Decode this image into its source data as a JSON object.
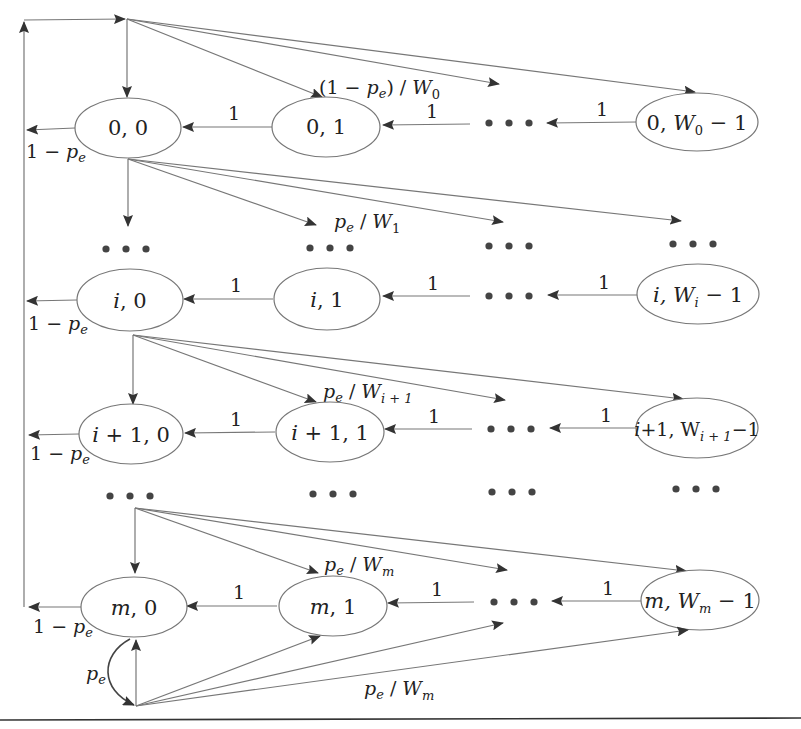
{
  "diagram": {
    "type": "Markov chain state transition diagram (backoff process)",
    "colors": {
      "line": "#777777",
      "arrowhead": "#333333",
      "text": "#222222",
      "background": "#ffffff"
    },
    "states": [
      {
        "id": "s00",
        "row": 0,
        "label_main": "0, 0"
      },
      {
        "id": "s01",
        "row": 0,
        "label_main": "0, 1"
      },
      {
        "id": "s0W",
        "row": 0,
        "label_pre": "0, ",
        "label_W": "W",
        "label_sub": "0",
        "label_post": " − 1"
      },
      {
        "id": "si0",
        "row": "i",
        "label_pre": "i",
        "label_post": ", 0"
      },
      {
        "id": "si1",
        "row": "i",
        "label_pre": "i",
        "label_post": ", 1"
      },
      {
        "id": "siW",
        "row": "i",
        "label_pre": "i",
        "label_mid": ", W",
        "label_sub": "i",
        "label_post": " − 1"
      },
      {
        "id": "si10",
        "row": "i+1",
        "label_pre": "i",
        "label_post": " + 1, 0"
      },
      {
        "id": "si11",
        "row": "i+1",
        "label_pre": "i",
        "label_post": " + 1, 1"
      },
      {
        "id": "si1W",
        "row": "i+1",
        "label_pre": "i",
        "label_mid": "+1, W",
        "label_sub": "i + 1",
        "label_post": "−1"
      },
      {
        "id": "sm0",
        "row": "m",
        "label_pre": "m",
        "label_post": ", 0"
      },
      {
        "id": "sm1",
        "row": "m",
        "label_pre": "m",
        "label_post": ", 1"
      },
      {
        "id": "smW",
        "row": "m",
        "label_pre": "m",
        "label_mid": ", W",
        "label_sub": "m",
        "label_post": " − 1"
      }
    ],
    "edge_labels": {
      "one": "1",
      "success_pre": "1 − ",
      "p": "p",
      "e": "e",
      "row0_fanout_pre": "(1 − ",
      "row0_fanout_post": ") / ",
      "W": "W",
      "sub_0": "0",
      "sub_1": "1",
      "sub_i1": "i + 1",
      "sub_m": "m",
      "slash": " / "
    },
    "ellipsis": "• • •"
  }
}
